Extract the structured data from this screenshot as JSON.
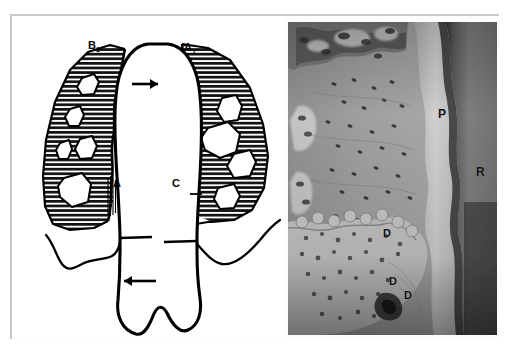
{
  "figure": {
    "background_color": "#ffffff",
    "frame_color": "#c9c9c9",
    "panels": [
      {
        "id": "diagram",
        "kind": "line-drawing",
        "description": "Schematic sagittal line drawing of a tooth root with surrounding alveolar bone shown in horizontal hatching; white lacunae/marrow spaces within the bone; two solid arrows indicate directions of drift; a wavy resorption front on the distal bone crest.",
        "ink_color": "#000000",
        "paper_color": "#ffffff",
        "labels": [
          {
            "id": "B1",
            "text": "B",
            "sub": "1",
            "x": 88,
            "y": 40,
            "size": 11
          },
          {
            "id": "A1",
            "text": "A",
            "sub": "1",
            "x": 184,
            "y": 42,
            "size": 11
          },
          {
            "id": "A",
            "text": "A",
            "sub": "",
            "x": 113,
            "y": 178,
            "size": 11
          },
          {
            "id": "C",
            "text": "C",
            "sub": "",
            "x": 172,
            "y": 178,
            "size": 11
          }
        ],
        "arrows": [
          {
            "id": "arrow-upper",
            "direction": "right",
            "x": 132,
            "y": 68,
            "length": 24
          },
          {
            "id": "arrow-lower",
            "direction": "left",
            "x": 118,
            "y": 265,
            "length": 28
          }
        ]
      },
      {
        "id": "photomicrograph",
        "kind": "histology-micrograph",
        "description": "Grayscale histological section showing alveolar bone (left), periodontal ligament space (center, light band) and tooth root dentin/cementum (right, dark band). Osteocyte lacunae appear as dark dots. Lower left shows a reversal/deposition front with irregular bone.",
        "labels": [
          {
            "id": "P",
            "text": "P",
            "x": 438,
            "y": 108,
            "size": 12
          },
          {
            "id": "R",
            "text": "R",
            "x": 476,
            "y": 166,
            "size": 12
          },
          {
            "id": "D1",
            "text": "D",
            "x": 383,
            "y": 228,
            "size": 11
          },
          {
            "id": "D2",
            "text": "D",
            "x": 389,
            "y": 276,
            "size": 11
          },
          {
            "id": "D3",
            "text": "D",
            "x": 404,
            "y": 290,
            "size": 11
          }
        ]
      }
    ]
  }
}
